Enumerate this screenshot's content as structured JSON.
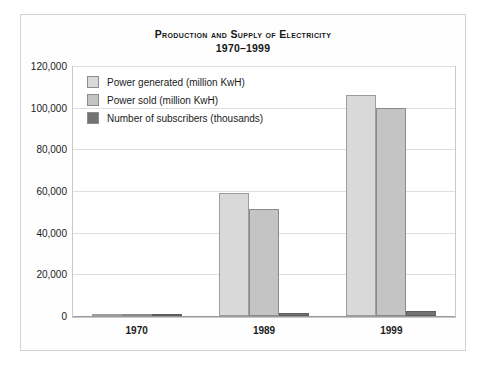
{
  "chart_data": {
    "type": "bar",
    "title": "Production and Supply of Electricity",
    "subtitle": "1970–1999",
    "xlabel": "",
    "ylabel": "",
    "categories": [
      "1970",
      "1989",
      "1999"
    ],
    "series": [
      {
        "name": "Power generated (million KwH)",
        "color": "#d9d9d9",
        "values": [
          500,
          59000,
          106000
        ]
      },
      {
        "name": "Power sold (million KwH)",
        "color": "#c4c4c4",
        "values": [
          400,
          51500,
          100000
        ]
      },
      {
        "name": "Number of subscribers (thousands)",
        "color": "#737373",
        "values": [
          300,
          1500,
          2500
        ]
      }
    ],
    "ylim": [
      0,
      120000
    ],
    "yticks": [
      "0",
      "20,000",
      "40,000",
      "60,000",
      "80,000",
      "100,000",
      "120,000"
    ],
    "ytick_values": [
      0,
      20000,
      40000,
      60000,
      80000,
      100000,
      120000
    ],
    "grid": true,
    "legend_position": "top-left-inside"
  },
  "legend": {
    "items": [
      {
        "label": "Power generated (million KwH)",
        "color": "#d9d9d9"
      },
      {
        "label": "Power sold (million KwH)",
        "color": "#c4c4c4"
      },
      {
        "label": "Number of subscribers (thousands)",
        "color": "#737373"
      }
    ]
  }
}
